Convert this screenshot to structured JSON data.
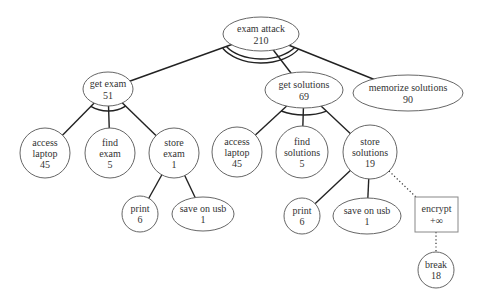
{
  "diagram": {
    "nodes": {
      "root": {
        "lines": [
          "exam attack"
        ],
        "value": "210",
        "shape": "ellipse",
        "gate": "AND (double arc)"
      },
      "get_exam": {
        "lines": [
          "get exam"
        ],
        "value": "51",
        "shape": "ellipse",
        "gate": "AND"
      },
      "get_solutions": {
        "lines": [
          "get solutions"
        ],
        "value": "69",
        "shape": "ellipse",
        "gate": "AND"
      },
      "memorize_solutions": {
        "lines": [
          "memorize solutions"
        ],
        "value": "90",
        "shape": "ellipse"
      },
      "access_laptop_1": {
        "lines": [
          "access",
          "laptop"
        ],
        "value": "45",
        "shape": "circle"
      },
      "find_exam": {
        "lines": [
          "find",
          "exam"
        ],
        "value": "5",
        "shape": "circle"
      },
      "store_exam": {
        "lines": [
          "store",
          "exam"
        ],
        "value": "1",
        "shape": "circle",
        "gate": "OR"
      },
      "print_1": {
        "lines": [
          "print"
        ],
        "value": "6",
        "shape": "circle"
      },
      "save_on_usb_1": {
        "lines": [
          "save on usb"
        ],
        "value": "1",
        "shape": "ellipse"
      },
      "access_laptop_2": {
        "lines": [
          "access",
          "laptop"
        ],
        "value": "45",
        "shape": "circle"
      },
      "find_solutions": {
        "lines": [
          "find",
          "solutions"
        ],
        "value": "5",
        "shape": "circle"
      },
      "store_solutions": {
        "lines": [
          "store",
          "solutions"
        ],
        "value": "19",
        "shape": "circle",
        "gate": "OR"
      },
      "print_2": {
        "lines": [
          "print"
        ],
        "value": "6",
        "shape": "circle"
      },
      "save_on_usb_2": {
        "lines": [
          "save on usb"
        ],
        "value": "1",
        "shape": "ellipse"
      },
      "encrypt": {
        "lines": [
          "encrypt"
        ],
        "value": "+∞",
        "shape": "rectangle"
      },
      "break": {
        "lines": [
          "break"
        ],
        "value": "18",
        "shape": "circle"
      }
    },
    "edges": [
      {
        "from": "root",
        "to": "get_exam",
        "style": "solid"
      },
      {
        "from": "root",
        "to": "get_solutions",
        "style": "solid"
      },
      {
        "from": "root",
        "to": "memorize_solutions",
        "style": "solid"
      },
      {
        "from": "get_exam",
        "to": "access_laptop_1",
        "style": "solid"
      },
      {
        "from": "get_exam",
        "to": "find_exam",
        "style": "solid"
      },
      {
        "from": "get_exam",
        "to": "store_exam",
        "style": "solid"
      },
      {
        "from": "store_exam",
        "to": "print_1",
        "style": "solid"
      },
      {
        "from": "store_exam",
        "to": "save_on_usb_1",
        "style": "solid"
      },
      {
        "from": "get_solutions",
        "to": "access_laptop_2",
        "style": "solid"
      },
      {
        "from": "get_solutions",
        "to": "find_solutions",
        "style": "solid"
      },
      {
        "from": "get_solutions",
        "to": "store_solutions",
        "style": "solid"
      },
      {
        "from": "store_solutions",
        "to": "print_2",
        "style": "solid"
      },
      {
        "from": "store_solutions",
        "to": "save_on_usb_2",
        "style": "solid"
      },
      {
        "from": "store_solutions",
        "to": "encrypt",
        "style": "dotted"
      },
      {
        "from": "encrypt",
        "to": "break",
        "style": "dotted"
      }
    ]
  }
}
